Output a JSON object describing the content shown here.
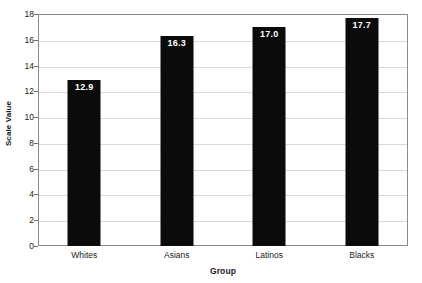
{
  "chart_data": {
    "type": "bar",
    "title": "",
    "categories": [
      "Whites",
      "Asians",
      "Latinos",
      "Blacks"
    ],
    "values": [
      12.9,
      16.3,
      17.0,
      17.7
    ],
    "value_labels": [
      "12.9",
      "16.3",
      "17.0",
      "17.7"
    ],
    "xlabel": "Group",
    "ylabel": "Scale Value",
    "ylim": [
      0,
      18
    ],
    "yticks": [
      0,
      2,
      4,
      6,
      8,
      10,
      12,
      14,
      16,
      18
    ],
    "ytick_labels": [
      "0",
      "2",
      "4",
      "6",
      "8",
      "10",
      "12",
      "14",
      "16",
      "18"
    ],
    "grid": true,
    "legend": false,
    "bar_color": "#0b0b0b",
    "value_label_color": "#ffffff",
    "gridline_color": "#d9d9d9",
    "frame_color": "#8a8a8a"
  }
}
